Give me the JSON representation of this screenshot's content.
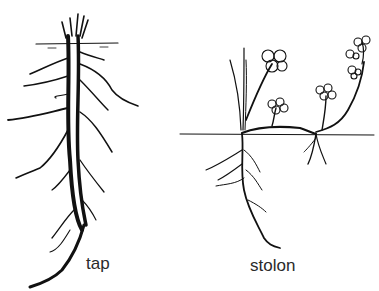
{
  "figure": {
    "panels": [
      {
        "id": "tap",
        "label": "tap",
        "description": "Tap root system with central thick root and lateral branches"
      },
      {
        "id": "stolon",
        "label": "stolon",
        "description": "Plant spreading by above-ground stolon with flowering nodes and rooting"
      }
    ]
  },
  "colors": {
    "ink": "#111111",
    "background": "#ffffff",
    "label": "#2a2a2a"
  }
}
